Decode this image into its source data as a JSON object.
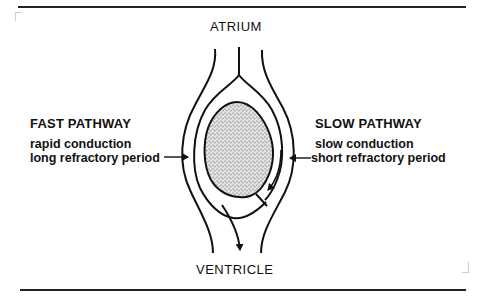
{
  "diagram": {
    "top_label": "ATRIUM",
    "bottom_label": "VENTRICLE",
    "left": {
      "heading": "FAST PATHWAY",
      "lines": [
        "rapid conduction",
        "long refractory period"
      ]
    },
    "right": {
      "heading": "SLOW PATHWAY",
      "lines": [
        "slow conduction",
        "short refractory period"
      ]
    },
    "colors": {
      "line": "#111111",
      "stipple_bg": "#d9d9d9",
      "stipple_dot": "#555555"
    }
  }
}
